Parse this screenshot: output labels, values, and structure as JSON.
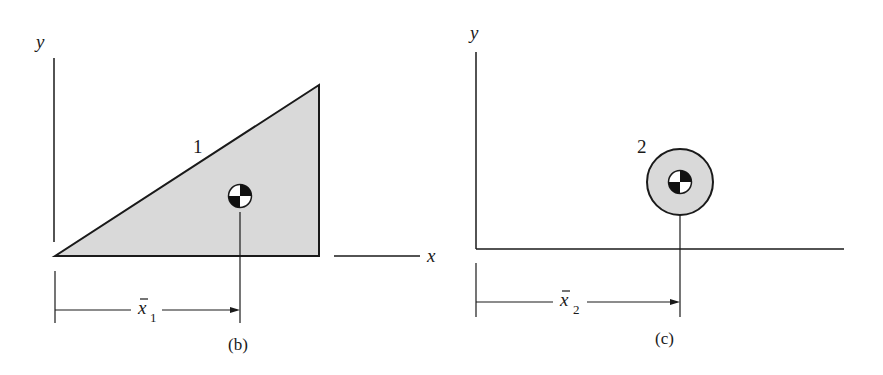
{
  "figure_b": {
    "caption": "(b)",
    "y_axis_label": "y",
    "x_axis_label": "x",
    "shape_label": "1",
    "shape": "right triangle",
    "dimension_label": "x",
    "dimension_subscript": "1"
  },
  "figure_c": {
    "caption": "(c)",
    "y_axis_label": "y",
    "shape_label": "2",
    "shape": "circle",
    "dimension_label": "x",
    "dimension_subscript": "2"
  },
  "colors": {
    "fill": "#d9d9d9",
    "stroke": "#1a1a1a"
  }
}
